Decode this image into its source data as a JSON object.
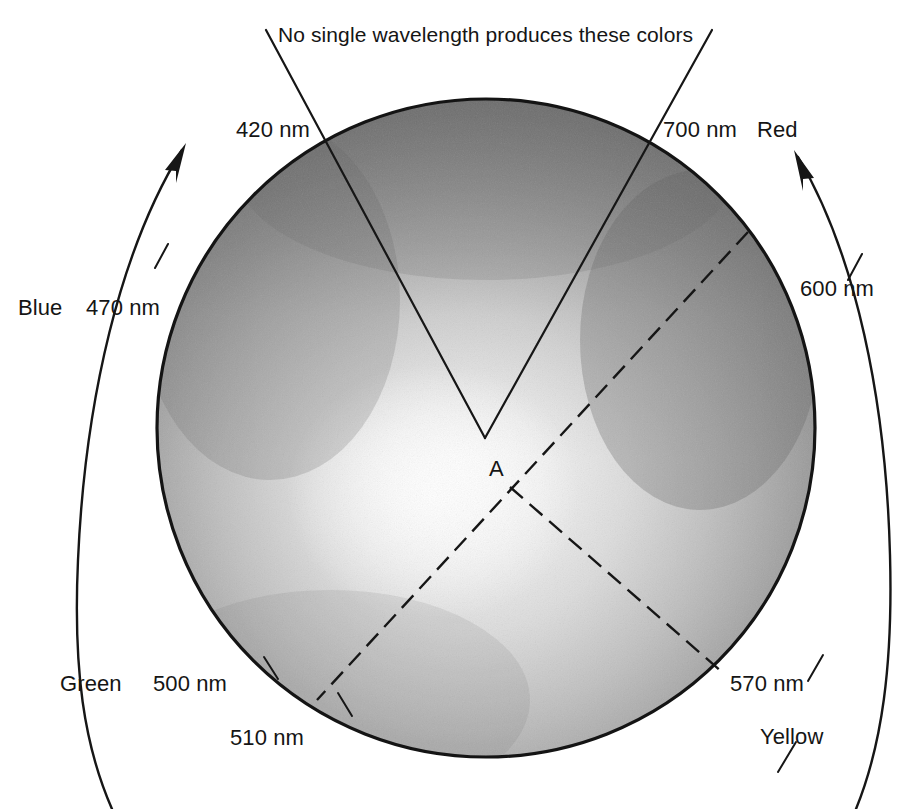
{
  "figure": {
    "kind": "chromaticity-disc-diagram",
    "caption_top": "No single wavelength produces these colors",
    "center_point_label": "A",
    "disc": {
      "center_x": 486,
      "center_y": 428,
      "radius": 329,
      "rim_shade": "#6f6f6f",
      "core_shade": "#f2f2f2",
      "outline_color": "#1a1a1a"
    },
    "hue_labels": [
      {
        "id": "red",
        "text": "Red",
        "x": 757,
        "y": 123
      },
      {
        "id": "blue",
        "text": "Blue",
        "x": 18,
        "y": 297
      },
      {
        "id": "green",
        "text": "Green",
        "x": 60,
        "y": 673
      },
      {
        "id": "yellow",
        "text": "Yellow",
        "x": 760,
        "y": 726
      }
    ],
    "wavelength_labels": [
      {
        "id": "nm-420",
        "text": "420 nm",
        "x": 236,
        "y": 119
      },
      {
        "id": "nm-700",
        "text": "700 nm",
        "x": 663,
        "y": 119
      },
      {
        "id": "nm-600",
        "text": "600 nm",
        "x": 800,
        "y": 278
      },
      {
        "id": "nm-470",
        "text": "470 nm",
        "x": 86,
        "y": 297
      },
      {
        "id": "nm-500",
        "text": "500 nm",
        "x": 153,
        "y": 673
      },
      {
        "id": "nm-510",
        "text": "510 nm",
        "x": 230,
        "y": 727
      },
      {
        "id": "nm-570",
        "text": "570 nm",
        "x": 730,
        "y": 673
      }
    ],
    "point_a": {
      "x": 498,
      "y": 466
    },
    "spectral_boundaries": {
      "note": "Solid lines bound the non-spectral purple wedge; dashed lines are complementary pairs through white point A.",
      "purple_wedge": {
        "vertex_x": 485,
        "vertex_y": 438,
        "left_end_deg": 108,
        "right_end_deg": 72
      },
      "dashed_pairs": [
        {
          "from": "600 nm",
          "to": "510 nm"
        },
        {
          "from": "570 nm",
          "to": "A"
        }
      ]
    },
    "arrows": [
      {
        "id": "left-hue-arrow",
        "direction": "counterclockwise-up"
      },
      {
        "id": "right-hue-arrow",
        "direction": "clockwise-up"
      }
    ]
  }
}
